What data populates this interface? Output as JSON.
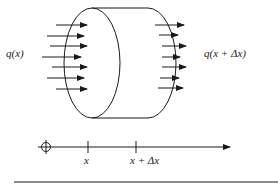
{
  "diagram": {
    "labels": {
      "inflow": "q(x)",
      "outflow": "q(x + Δx)",
      "tick_x": "x",
      "tick_x_dx": "x + Δx"
    },
    "elements": {
      "cylinder": {
        "left_face": "ellipse",
        "right_face": "half-ellipse arc"
      },
      "inflow_arrows": 7,
      "outflow_arrows": 7,
      "axis": {
        "origin_marker": "circle-with-crosshair",
        "ticks": [
          "x",
          "x + Δx"
        ],
        "direction": "right"
      }
    },
    "colors": {
      "stroke": "#1a1a1a",
      "background": "#ffffff"
    }
  }
}
